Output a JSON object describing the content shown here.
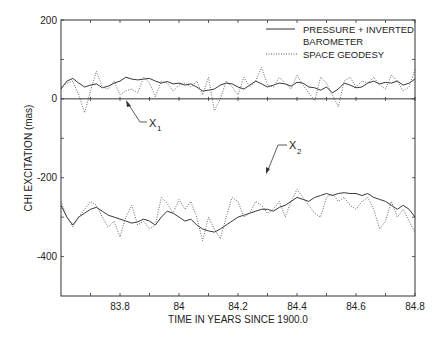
{
  "chart_data": {
    "type": "line",
    "title": "",
    "xlabel": "TIME IN YEARS SINCE 1900.0",
    "ylabel": "CHI EXCITATION (mas)",
    "xlim": [
      83.6,
      84.8
    ],
    "ylim": [
      -500,
      200
    ],
    "xticks": [
      83.8,
      84.0,
      84.2,
      84.4,
      84.6,
      84.8
    ],
    "xtick_labels": [
      "83.8",
      "84",
      "84.2",
      "84.4",
      "84.6",
      "84.8"
    ],
    "yticks": [
      200,
      0,
      -200,
      -400
    ],
    "ytick_labels": [
      "200",
      "0",
      "-200",
      "-400"
    ],
    "zero_line": true,
    "grid": false,
    "legend": {
      "position": "upper right",
      "entries": [
        {
          "label_line1": "PRESSURE + INVERTED",
          "label_line2": "BAROMETER",
          "style": "solid"
        },
        {
          "label_line1": "SPACE GEODESY",
          "label_line2": "",
          "style": "dotted"
        }
      ]
    },
    "annotations": [
      {
        "text": "X",
        "subscript": "1",
        "x": 83.88,
        "y": -65,
        "arrow_to": [
          83.83,
          -10
        ]
      },
      {
        "text": "X",
        "subscript": "2",
        "x": 84.35,
        "y": -115,
        "arrow_to": [
          84.3,
          -185
        ]
      }
    ],
    "x": [
      83.6,
      83.62,
      83.64,
      83.66,
      83.68,
      83.7,
      83.72,
      83.74,
      83.76,
      83.78,
      83.8,
      83.82,
      83.84,
      83.86,
      83.88,
      83.9,
      83.92,
      83.94,
      83.96,
      83.98,
      84.0,
      84.02,
      84.04,
      84.06,
      84.08,
      84.1,
      84.12,
      84.14,
      84.16,
      84.18,
      84.2,
      84.22,
      84.24,
      84.26,
      84.28,
      84.3,
      84.32,
      84.34,
      84.36,
      84.38,
      84.4,
      84.42,
      84.44,
      84.46,
      84.48,
      84.5,
      84.52,
      84.54,
      84.56,
      84.58,
      84.6,
      84.62,
      84.64,
      84.66,
      84.68,
      84.7,
      84.72,
      84.74,
      84.76,
      84.78,
      84.8
    ],
    "series": [
      {
        "name": "X1 PRESSURE + INVERTED BAROMETER",
        "style": "solid",
        "values": [
          25,
          45,
          52,
          40,
          30,
          35,
          38,
          28,
          32,
          40,
          45,
          55,
          50,
          48,
          50,
          52,
          45,
          40,
          44,
          38,
          40,
          35,
          38,
          30,
          20,
          22,
          25,
          35,
          40,
          38,
          30,
          25,
          35,
          45,
          38,
          30,
          35,
          40,
          38,
          32,
          42,
          40,
          30,
          28,
          22,
          30,
          15,
          25,
          40,
          35,
          28,
          30,
          40,
          45,
          38,
          42,
          40,
          45,
          35,
          40,
          50
        ]
      },
      {
        "name": "X1 SPACE GEODESY",
        "style": "dotted",
        "values": [
          30,
          40,
          45,
          10,
          -35,
          20,
          70,
          30,
          25,
          45,
          10,
          20,
          25,
          15,
          55,
          40,
          5,
          45,
          40,
          20,
          35,
          40,
          30,
          45,
          10,
          55,
          -30,
          0,
          45,
          30,
          10,
          55,
          30,
          45,
          80,
          35,
          30,
          55,
          40,
          25,
          60,
          35,
          15,
          -5,
          55,
          40,
          10,
          -20,
          45,
          55,
          30,
          45,
          40,
          55,
          35,
          25,
          60,
          45,
          20,
          30,
          75
        ]
      },
      {
        "name": "X2 PRESSURE + INVERTED BAROMETER",
        "style": "solid",
        "values": [
          -270,
          -300,
          -320,
          -300,
          -290,
          -280,
          -275,
          -285,
          -295,
          -300,
          -305,
          -310,
          -315,
          -312,
          -305,
          -310,
          -320,
          -300,
          -285,
          -290,
          -300,
          -310,
          -305,
          -320,
          -330,
          -335,
          -338,
          -330,
          -320,
          -310,
          -300,
          -295,
          -290,
          -285,
          -280,
          -280,
          -285,
          -275,
          -270,
          -260,
          -250,
          -255,
          -260,
          -250,
          -245,
          -240,
          -245,
          -240,
          -238,
          -240,
          -240,
          -245,
          -240,
          -250,
          -255,
          -260,
          -270,
          -280,
          -270,
          -280,
          -300
        ]
      },
      {
        "name": "X2 SPACE GEODESY",
        "style": "dotted",
        "values": [
          -260,
          -300,
          -325,
          -300,
          -280,
          -260,
          -270,
          -300,
          -325,
          -310,
          -350,
          -300,
          -270,
          -320,
          -310,
          -330,
          -320,
          -250,
          -265,
          -290,
          -255,
          -280,
          -260,
          -300,
          -360,
          -300,
          -330,
          -355,
          -300,
          -250,
          -260,
          -300,
          -290,
          -260,
          -270,
          -290,
          -280,
          -260,
          -300,
          -260,
          -230,
          -250,
          -270,
          -290,
          -300,
          -250,
          -240,
          -260,
          -250,
          -270,
          -280,
          -260,
          -250,
          -280,
          -330,
          -310,
          -260,
          -300,
          -280,
          -310,
          -340
        ]
      }
    ]
  }
}
